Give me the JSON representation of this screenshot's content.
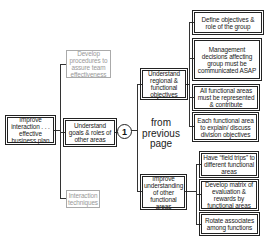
{
  "diagram": {
    "root": {
      "label": "Improve interaction . . . effective business plan"
    },
    "level1": [
      {
        "label": "Develop procedures to assure team effectiveness",
        "style": "gray"
      },
      {
        "label": "Understand goals & roles of other areas",
        "style": "normal"
      },
      {
        "label": "Interaction techniques",
        "style": "gray"
      }
    ],
    "connector": {
      "label": "1"
    },
    "continuation_note": "from previous page",
    "level2": [
      {
        "label": "Understand regional & functional objectives",
        "children": [
          "Define objectives & role of the group",
          "Management decisions affecting group must be communicated ASAP",
          "All functional areas must be represented & contribute",
          "Each functional area to explain/ discuss division objectives"
        ]
      },
      {
        "label": "Improve understanding of other functional areas",
        "children": [
          "Have “field trips” to different functional areas",
          "Develop matrix of evaluation & rewards by functional areas",
          "Rotate associates among functions"
        ]
      }
    ]
  }
}
